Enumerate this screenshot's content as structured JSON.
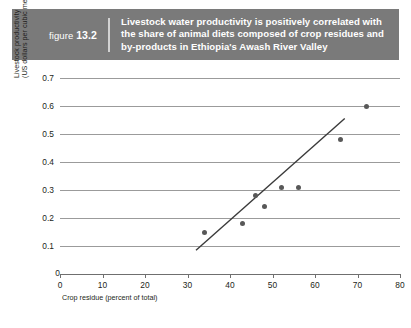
{
  "figure": {
    "label_prefix": "figure",
    "number": "13.2",
    "title": "Livestock water productivity is positively correlated with the share of animal diets composed of crop residues and by-products in Ethiopia's Awash River Valley",
    "header_color": "#7a7a7a",
    "header_text_color": "#ffffff"
  },
  "chart_data": {
    "type": "scatter",
    "title": "Livestock water productivity is positively correlated with the share of animal diets composed of crop residues and by-products in Ethiopia's Awash River Valley",
    "xlabel": "Crop residue (percent of total)",
    "ylabel": "Livestock productivity (US dollars per cubic meter)",
    "ylabel_line1": "Livestock productivity",
    "ylabel_line2": "(US dollars per cubic meter)",
    "xlim": [
      0,
      80
    ],
    "ylim": [
      0,
      0.7
    ],
    "xticks": [
      0,
      10,
      20,
      30,
      40,
      50,
      60,
      70,
      80
    ],
    "xtick_labels": [
      "0",
      "10",
      "20",
      "30",
      "40",
      "50",
      "60",
      "70",
      "80"
    ],
    "yticks": [
      0.1,
      0.2,
      0.3,
      0.4,
      0.5,
      0.6,
      0.7
    ],
    "ytick_labels": [
      "0.1",
      "0.2",
      "0.3",
      "0.4",
      "0.5",
      "0.6",
      "0.7"
    ],
    "y_zero_label": "0",
    "grid": "horizontal",
    "legend": "none",
    "point_color": "#585858",
    "line_color": "#3a3a3a",
    "gridline_color": "#9b9b9b",
    "points": [
      {
        "x": 34,
        "y": 0.15
      },
      {
        "x": 43,
        "y": 0.18
      },
      {
        "x": 46,
        "y": 0.28
      },
      {
        "x": 48,
        "y": 0.24
      },
      {
        "x": 52,
        "y": 0.31
      },
      {
        "x": 56,
        "y": 0.31
      },
      {
        "x": 66,
        "y": 0.48
      },
      {
        "x": 72,
        "y": 0.6
      }
    ],
    "trend_line": {
      "x_start": 32,
      "y_start": 0.085,
      "x_end": 67,
      "y_end": 0.555
    }
  }
}
